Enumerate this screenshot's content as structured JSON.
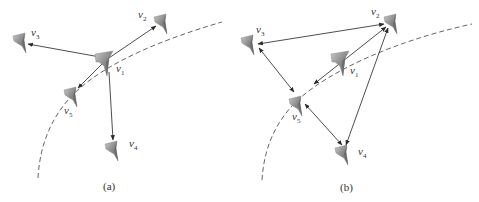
{
  "figure": {
    "panels": [
      {
        "id": "a",
        "caption": "(a)",
        "description": "Star topology: v1 has directed links to v2, v3, v4, v5",
        "nodes": [
          {
            "id": "v1",
            "label": "v",
            "sub": "1"
          },
          {
            "id": "v2",
            "label": "v",
            "sub": "2"
          },
          {
            "id": "v3",
            "label": "v",
            "sub": "3"
          },
          {
            "id": "v4",
            "label": "v",
            "sub": "4"
          },
          {
            "id": "v5",
            "label": "v",
            "sub": "5"
          }
        ],
        "edges": [
          {
            "from": "v1",
            "to": "v2",
            "type": "directed"
          },
          {
            "from": "v1",
            "to": "v3",
            "type": "directed"
          },
          {
            "from": "v1",
            "to": "v4",
            "type": "directed"
          },
          {
            "from": "v1",
            "to": "v5",
            "type": "directed"
          }
        ],
        "trajectory": "dashed arc"
      },
      {
        "id": "b",
        "caption": "(b)",
        "description": "Mesh topology among v2, v3, v4, v5 with v1 linked",
        "nodes": [
          {
            "id": "v1",
            "label": "v",
            "sub": "1"
          },
          {
            "id": "v2",
            "label": "v",
            "sub": "2"
          },
          {
            "id": "v3",
            "label": "v",
            "sub": "3"
          },
          {
            "id": "v4",
            "label": "v",
            "sub": "4"
          },
          {
            "id": "v5",
            "label": "v",
            "sub": "5"
          }
        ],
        "edges": [
          {
            "from": "v2",
            "to": "v3",
            "type": "bidirectional"
          },
          {
            "from": "v2",
            "to": "v4",
            "type": "bidirectional"
          },
          {
            "from": "v2",
            "to": "v5",
            "type": "bidirectional"
          },
          {
            "from": "v3",
            "to": "v5",
            "type": "bidirectional"
          },
          {
            "from": "v5",
            "to": "v4",
            "type": "bidirectional"
          }
        ],
        "trajectory": "dashed arc"
      }
    ],
    "colors": {
      "drone_light": "#b8b8b8",
      "drone_dark": "#6e6e6e",
      "edge": "#3a3a3a",
      "arc": "#555555"
    }
  }
}
